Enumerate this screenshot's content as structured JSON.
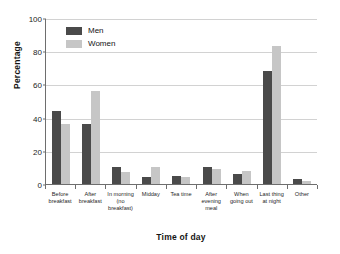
{
  "chart_data": {
    "type": "bar",
    "title": "",
    "xlabel": "Time of day",
    "ylabel": "Percentage",
    "ylim": [
      0,
      100
    ],
    "yticks": [
      0,
      20,
      40,
      60,
      80,
      100
    ],
    "grid": true,
    "legend_position": "top-left",
    "categories": [
      "Before breakfast",
      "After breakfast",
      "In morning (no breakfast)",
      "Midday",
      "Tea time",
      "After evening meal",
      "When going out",
      "Last thing at night",
      "Other"
    ],
    "category_lines": [
      [
        "Before",
        "breakfast"
      ],
      [
        "After",
        "breakfast"
      ],
      [
        "In morning",
        "(no",
        "breakfast)"
      ],
      [
        "Midday"
      ],
      [
        "Tea time"
      ],
      [
        "After",
        "evening",
        "meal"
      ],
      [
        "When",
        "going out"
      ],
      [
        "Last thing",
        "at night"
      ],
      [
        "Other"
      ]
    ],
    "series": [
      {
        "name": "Men",
        "color": "#4a4a4a",
        "values": [
          44,
          36,
          10,
          4,
          5,
          10,
          6,
          68,
          3
        ]
      },
      {
        "name": "Women",
        "color": "#c6c6c6",
        "values": [
          36,
          56,
          7,
          10,
          4,
          9,
          8,
          83,
          2
        ]
      }
    ]
  },
  "axis": {
    "y_title": "Percentage",
    "x_title": "Time of day"
  }
}
